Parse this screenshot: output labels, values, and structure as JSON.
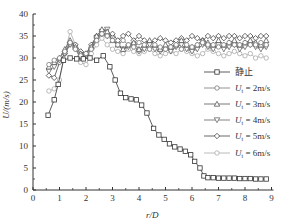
{
  "chart_data": {
    "type": "line",
    "title": "",
    "xlabel": "r/D",
    "ylabel": "U/(m/s)",
    "xlim": [
      0,
      9
    ],
    "ylim": [
      0,
      40
    ],
    "xticks": [
      0,
      1,
      2,
      3,
      4,
      5,
      6,
      7,
      8,
      9
    ],
    "yticks": [
      0,
      5,
      10,
      15,
      20,
      25,
      30,
      35,
      40
    ],
    "grid": false,
    "legend_position": "right-middle",
    "series": [
      {
        "name": "静止",
        "marker": "square",
        "color": "#333333",
        "x": [
          0.57,
          0.8,
          0.95,
          1.15,
          1.4,
          1.65,
          1.9,
          2.15,
          2.4,
          2.65,
          2.9,
          3.1,
          3.3,
          3.5,
          3.7,
          3.9,
          4.1,
          4.3,
          4.55,
          4.75,
          4.95,
          5.15,
          5.35,
          5.55,
          5.75,
          5.95,
          6.1,
          6.3,
          6.45,
          6.6,
          6.8,
          7.0,
          7.2,
          7.4,
          7.6,
          7.8,
          8.0,
          8.2,
          8.4,
          8.6,
          8.8
        ],
        "y": [
          17,
          20.5,
          24,
          29.5,
          30,
          29.8,
          29.8,
          30,
          29.5,
          30.5,
          28,
          25,
          22,
          21,
          20.7,
          20.5,
          19.3,
          17.5,
          14,
          12.5,
          11.5,
          10.5,
          9.8,
          9.3,
          8.8,
          8,
          6.5,
          5,
          3.2,
          2.8,
          2.8,
          2.7,
          2.7,
          2.7,
          2.7,
          2.6,
          2.6,
          2.6,
          2.5,
          2.5,
          2.5
        ]
      },
      {
        "name": "Ut = 2m/s",
        "marker": "circle",
        "color": "#777777",
        "x": [
          0.6,
          0.8,
          1.0,
          1.2,
          1.4,
          1.6,
          1.8,
          2.0,
          2.2,
          2.4,
          2.6,
          2.8,
          3.0,
          3.2,
          3.4,
          3.6,
          3.8,
          4.0,
          4.2,
          4.4,
          4.6,
          4.8,
          5.0,
          5.2,
          5.4,
          5.6,
          5.8,
          6.0,
          6.2,
          6.4,
          6.6,
          6.8,
          7.0,
          7.2,
          7.4,
          7.6,
          7.8,
          8.0,
          8.2,
          8.4,
          8.6,
          8.8
        ],
        "y": [
          28.5,
          29.5,
          30,
          31.5,
          33.5,
          32,
          30.5,
          31,
          32,
          34,
          35.5,
          35,
          34,
          33,
          34,
          33,
          32.5,
          33.5,
          33,
          32,
          33,
          32.5,
          32,
          32.5,
          33,
          32,
          33,
          32.5,
          33,
          33.5,
          33,
          33,
          32.5,
          33,
          33.5,
          33,
          33,
          33.5,
          33,
          33,
          33.5,
          33
        ]
      },
      {
        "name": "Ut = 3m/s",
        "marker": "triangle-up",
        "color": "#555555",
        "x": [
          0.6,
          0.8,
          1.0,
          1.2,
          1.4,
          1.6,
          1.8,
          2.0,
          2.2,
          2.4,
          2.6,
          2.8,
          3.0,
          3.2,
          3.4,
          3.6,
          3.8,
          4.0,
          4.2,
          4.4,
          4.6,
          4.8,
          5.0,
          5.2,
          5.4,
          5.6,
          5.8,
          6.0,
          6.2,
          6.4,
          6.6,
          6.8,
          7.0,
          7.2,
          7.4,
          7.6,
          7.8,
          8.0,
          8.2,
          8.4,
          8.6,
          8.8
        ],
        "y": [
          28,
          29,
          30,
          32,
          34,
          32.5,
          31,
          31,
          32.5,
          35,
          36.5,
          36,
          34,
          33,
          32,
          33,
          33.5,
          32,
          33,
          34,
          33,
          32,
          33,
          32.5,
          33,
          34,
          33,
          32.5,
          33,
          34,
          33.5,
          33,
          34,
          33,
          33.5,
          34,
          33,
          33.5,
          34,
          33.5,
          33,
          34
        ]
      },
      {
        "name": "Ut = 4m/s",
        "marker": "triangle-down",
        "color": "#666666",
        "x": [
          0.6,
          0.8,
          1.0,
          1.2,
          1.4,
          1.6,
          1.8,
          2.0,
          2.2,
          2.4,
          2.6,
          2.8,
          3.0,
          3.2,
          3.4,
          3.6,
          3.8,
          4.0,
          4.2,
          4.4,
          4.6,
          4.8,
          5.0,
          5.2,
          5.4,
          5.6,
          5.8,
          6.0,
          6.2,
          6.4,
          6.6,
          6.8,
          7.0,
          7.2,
          7.4,
          7.6,
          7.8,
          8.0,
          8.2,
          8.4,
          8.6,
          8.8
        ],
        "y": [
          27,
          28,
          29.5,
          31,
          33,
          32,
          30,
          30.5,
          32,
          34.5,
          36,
          36.5,
          34.5,
          33,
          32,
          32.5,
          33,
          31.5,
          32,
          33,
          32,
          31.5,
          32,
          31.5,
          32.5,
          33,
          32,
          31.5,
          32,
          33,
          32.5,
          32,
          33,
          32,
          32.5,
          33,
          32,
          32.5,
          33,
          32.5,
          32,
          32.5
        ]
      },
      {
        "name": "Ut = 5m/s",
        "marker": "diamond",
        "color": "#444444",
        "x": [
          0.6,
          0.8,
          1.0,
          1.2,
          1.4,
          1.6,
          1.8,
          2.0,
          2.2,
          2.4,
          2.6,
          2.8,
          3.0,
          3.2,
          3.4,
          3.6,
          3.8,
          4.0,
          4.2,
          4.4,
          4.6,
          4.8,
          5.0,
          5.2,
          5.4,
          5.6,
          5.8,
          6.0,
          6.2,
          6.4,
          6.6,
          6.8,
          7.0,
          7.2,
          7.4,
          7.6,
          7.8,
          8.0,
          8.2,
          8.4,
          8.6,
          8.8
        ],
        "y": [
          26,
          25.5,
          29,
          31,
          33.5,
          33,
          31.5,
          31,
          33,
          35,
          35.5,
          35,
          35.5,
          34,
          35,
          35.5,
          34,
          35,
          34,
          33.5,
          34,
          34.5,
          34,
          33.5,
          34,
          34.5,
          34,
          35,
          34.5,
          34,
          35,
          34.5,
          35,
          34.5,
          35,
          35,
          34.5,
          35,
          35,
          34.5,
          35,
          35
        ]
      },
      {
        "name": "Ut = 6m/s",
        "marker": "circle",
        "color": "#aaaaaa",
        "x": [
          0.6,
          0.8,
          1.0,
          1.2,
          1.4,
          1.6,
          1.8,
          2.0,
          2.2,
          2.4,
          2.6,
          2.8,
          3.0,
          3.2,
          3.4,
          3.6,
          3.8,
          4.0,
          4.2,
          4.4,
          4.6,
          4.8,
          5.0,
          5.2,
          5.4,
          5.6,
          5.8,
          6.0,
          6.2,
          6.4,
          6.6,
          6.8,
          7.0,
          7.2,
          7.4,
          7.6,
          7.8,
          8.0,
          8.2,
          8.4,
          8.6,
          8.8
        ],
        "y": [
          22.5,
          23,
          25,
          31,
          36,
          33,
          29,
          28.5,
          31,
          33,
          34.5,
          33,
          32,
          31.5,
          31,
          32,
          31.5,
          31,
          31.5,
          32,
          31,
          30.5,
          31,
          31.5,
          31,
          32,
          31.5,
          31,
          30.5,
          31,
          32,
          31.5,
          31,
          30.5,
          31,
          31.5,
          31,
          30.5,
          31,
          30,
          30.5,
          30
        ]
      }
    ]
  },
  "axes": {
    "xlabel": "r/D",
    "ylabel": "U/(m/s)",
    "xtick_labels": [
      "0",
      "1",
      "2",
      "3",
      "4",
      "5",
      "6",
      "7",
      "8",
      "9"
    ],
    "ytick_labels": [
      "0",
      "5",
      "10",
      "15",
      "20",
      "25",
      "30",
      "35",
      "40"
    ]
  },
  "legend": {
    "items": [
      {
        "label": "静止"
      },
      {
        "label": "Ut = 2m/s"
      },
      {
        "label": "Ut = 3m/s"
      },
      {
        "label": "Ut = 4m/s"
      },
      {
        "label": "Ut = 5m/s"
      },
      {
        "label": "Ut = 6m/s"
      }
    ]
  }
}
